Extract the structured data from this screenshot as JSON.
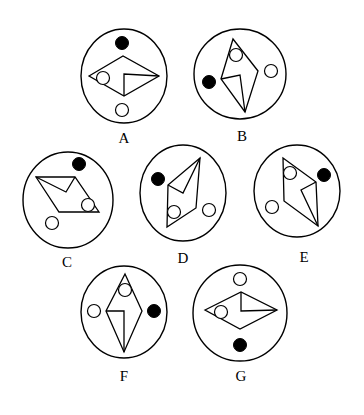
{
  "puzzle": {
    "type": "odd-one-out figure reasoning",
    "figures": [
      {
        "label": "A",
        "description": "horizontal rhombus with inner notch, hollow circle in left corner, black dot above, hollow dot below"
      },
      {
        "label": "B",
        "description": "vertical rhombus with inner notch, hollow circle at top corner, black dot left, hollow dot right"
      },
      {
        "label": "C",
        "description": "parallelogram with inner notch, hollow circle at right corner, black dot top-right, hollow dot bottom-left"
      },
      {
        "label": "D",
        "description": "tilted rhombus with inner notch, hollow circle at bottom corner, black dot upper-left, hollow dot lower-right"
      },
      {
        "label": "E",
        "description": "tilted rhombus with inner notch, hollow circle at top corner, black dot upper-right, hollow dot lower-left"
      },
      {
        "label": "F",
        "description": "vertical rhombus with inner notch, hollow circle at top corner, hollow dot left, black dot right"
      },
      {
        "label": "G",
        "description": "horizontal rhombus with inner notch, hollow circle in left corner, hollow dot above, black dot below"
      }
    ]
  }
}
